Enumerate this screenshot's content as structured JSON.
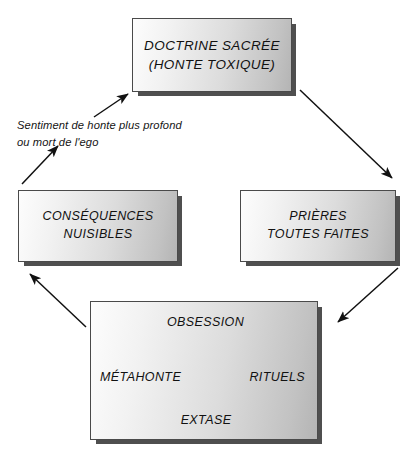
{
  "diagram": {
    "background_color": "#ffffff",
    "ink_color": "#111111",
    "box_shadow_color": "#4f4f4f",
    "box_border_color": "#4a4a4a"
  },
  "nodes": {
    "doctrine": {
      "line1": "DOCTRINE SACRÉE",
      "line2": "(HONTE TOXIQUE)"
    },
    "consequences": {
      "line1": "CONSÉQUENCES",
      "line2": "NUISIBLES"
    },
    "prieres": {
      "line1": "PRIÈRES",
      "line2": "TOUTES FAITES"
    }
  },
  "cycle": {
    "labels": {
      "obsession": "OBSESSION",
      "rituels": "RITUELS",
      "extase": "EXTASE",
      "metahonte": "MÉTAHONTE"
    },
    "order": [
      "OBSESSION",
      "RITUELS",
      "EXTASE",
      "MÉTAHONTE"
    ],
    "direction": "clockwise"
  },
  "annotation": {
    "line1": "Sentiment de honte plus profond",
    "line2": "ou mort de l'ego"
  },
  "edges": [
    {
      "id": "doctrine-to-prieres",
      "from": "DOCTRINE SACRÉE (HONTE TOXIQUE)",
      "to": "PRIÈRES TOUTES FAITES",
      "label": ""
    },
    {
      "id": "prieres-to-cycle",
      "from": "PRIÈRES TOUTES FAITES",
      "to": "OBSESSION / RITUELS / EXTASE / MÉTAHONTE",
      "label": ""
    },
    {
      "id": "cycle-to-consequences",
      "from": "OBSESSION / RITUELS / EXTASE / MÉTAHONTE",
      "to": "CONSÉQUENCES NUISIBLES",
      "label": ""
    },
    {
      "id": "consequences-to-doctrine",
      "from": "CONSÉQUENCES NUISIBLES",
      "to": "DOCTRINE SACRÉE (HONTE TOXIQUE)",
      "label": "Sentiment de honte plus profond ou mort de l'ego"
    },
    {
      "id": "metahonte-to-obsession",
      "from": "MÉTAHONTE",
      "to": "OBSESSION",
      "label": ""
    },
    {
      "id": "obsession-to-rituels",
      "from": "OBSESSION",
      "to": "RITUELS",
      "label": ""
    },
    {
      "id": "rituels-to-extase",
      "from": "RITUELS",
      "to": "EXTASE",
      "label": ""
    },
    {
      "id": "extase-to-metahonte",
      "from": "EXTASE",
      "to": "MÉTAHONTE",
      "label": ""
    }
  ]
}
